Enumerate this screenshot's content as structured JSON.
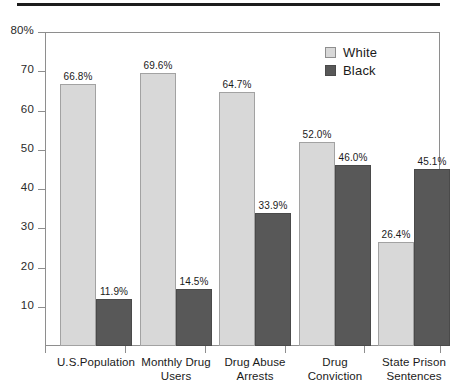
{
  "chart_data": {
    "type": "bar",
    "title": "",
    "xlabel": "",
    "ylabel": "",
    "ylim": [
      0,
      80
    ],
    "grid": false,
    "legend_position": "top-right",
    "categories": [
      "U.S.Population",
      "Monthly Drug Users",
      "Drug Abuse Arrests",
      "Drug Conviction",
      "State Prison Sentences"
    ],
    "category_lines": [
      [
        "U.S.Population"
      ],
      [
        "Monthly Drug",
        "Users"
      ],
      [
        "Drug Abuse",
        "Arrests"
      ],
      [
        "Drug",
        "Conviction"
      ],
      [
        "State Prison",
        "Sentences"
      ]
    ],
    "series": [
      {
        "name": "White",
        "color": "#d8d8d8",
        "values": [
          66.8,
          69.6,
          64.7,
          52.0,
          26.4
        ],
        "labels": [
          "66.8%",
          "69.6%",
          "64.7%",
          "52.0%",
          "26.4%"
        ]
      },
      {
        "name": "Black",
        "color": "#585858",
        "values": [
          11.9,
          14.5,
          33.9,
          46.0,
          45.1
        ],
        "labels": [
          "11.9%",
          "14.5%",
          "33.9%",
          "46.0%",
          "45.1%"
        ]
      }
    ],
    "y_ticks": [
      {
        "value": 80,
        "label": "80%"
      },
      {
        "value": 70,
        "label": "70"
      },
      {
        "value": 60,
        "label": "60"
      },
      {
        "value": 50,
        "label": "50"
      },
      {
        "value": 40,
        "label": "40"
      },
      {
        "value": 30,
        "label": "30"
      },
      {
        "value": 20,
        "label": "20"
      },
      {
        "value": 10,
        "label": "10"
      }
    ]
  },
  "legend": {
    "items": [
      {
        "label": "White",
        "swatch": "white"
      },
      {
        "label": "Black",
        "swatch": "black"
      }
    ]
  }
}
